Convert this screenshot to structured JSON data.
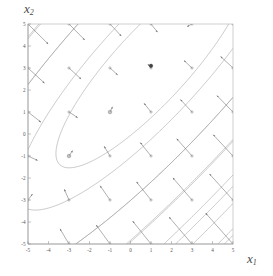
{
  "figure": {
    "title": "",
    "xlabel": "x",
    "xlabel_sub": "1",
    "ylabel": "x",
    "ylabel_sub": "2"
  },
  "chart_data": {
    "type": "line",
    "subtype": "contour-plot-with-gradient-vector-field",
    "title": "",
    "xlabel": "x1",
    "ylabel": "x2",
    "xlim": [
      -5,
      5
    ],
    "ylim": [
      -5,
      5
    ],
    "grid": false,
    "legend": null,
    "xticks": [
      -5,
      -4,
      -3,
      -2,
      -1,
      0,
      1,
      2,
      3,
      4,
      5
    ],
    "xtick_labels": [
      "-5",
      "-4",
      "-3",
      "-2",
      "-1",
      "0",
      "1",
      "2",
      "3",
      "4",
      "5"
    ],
    "yticks": [
      -5,
      -4,
      -3,
      -2,
      -1,
      0,
      1,
      2,
      3,
      4,
      5
    ],
    "ytick_labels": [
      "-5",
      "-4",
      "-3",
      "-2",
      "-1",
      "0",
      "1",
      "2",
      "3",
      "4",
      "5"
    ],
    "contour_description": "Nested elongated elliptical level curves of a quadratic function, major axis oriented along the +45 degree diagonal; innermost closed curve encircles the maximum near (1, 3); outer level curves open out toward the lower-left and upper-right corners.",
    "contour_center": [
      1.0,
      3.1
    ],
    "contour_levels": [
      -100,
      -80,
      -60,
      -45,
      -32,
      -22,
      -14,
      -8,
      -4,
      -1,
      0,
      1,
      2
    ],
    "critical_points": [
      {
        "marker": "filled-dot",
        "x": 1.0,
        "y": 3.1,
        "label": "maximum"
      },
      {
        "marker": "open-circle",
        "x": -1.0,
        "y": 1.0,
        "label": "sample-point"
      },
      {
        "marker": "open-circle",
        "x": -3.0,
        "y": -1.0,
        "label": "sample-point"
      }
    ],
    "vector_field": {
      "description": "Gradient (steepest ascent) arrows drawn on an integer grid; arrows point toward the contour center near (1, 3) and grow longer with distance from it.",
      "grid_x": [
        -5,
        -3,
        -1,
        1,
        3,
        5
      ],
      "grid_y": [
        -5,
        -3,
        -1,
        1,
        3,
        5
      ],
      "arrow_color": "#6e6e6e"
    },
    "hatch_fill": {
      "description": "Dense diagonal hatching formed by closely-spaced outer level curves in the upper-left and lower-right corners.",
      "angle_deg": 45,
      "color": "#9a9a9a"
    },
    "colors": {
      "contour": "#8f8f8f",
      "axis": "#9a9a9a",
      "frame": "#b0b0b0",
      "arrow": "#6e6e6e",
      "tick_text": "#555555",
      "label_text": "#4a4a4a",
      "background": "#ffffff"
    }
  }
}
